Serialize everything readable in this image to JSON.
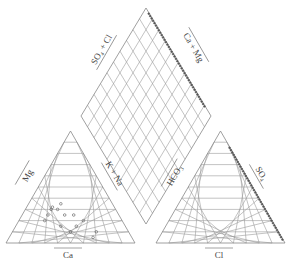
{
  "diagram": {
    "type": "piper",
    "labels": {
      "left_mg": "Mg",
      "left_kna": "K + Na",
      "left_ca": "Ca",
      "right_hco3": "HCO₃",
      "right_so4": "SO₄",
      "right_cl": "Cl",
      "diamond_so4cl": "SO₄ + Cl",
      "diamond_camg": "Ca + Mg"
    },
    "colors": {
      "grid": "#9a9a9a",
      "outline": "#888888",
      "points": "#555555",
      "text": "#444444"
    },
    "grid_divisions": 10
  },
  "chart_data": {
    "type": "scatter",
    "title": "",
    "cation_points_approx": [
      {
        "ca": 50,
        "mg": 30,
        "kna": 20
      },
      {
        "ca": 48,
        "mg": 32,
        "kna": 20
      },
      {
        "ca": 45,
        "mg": 30,
        "kna": 25
      },
      {
        "ca": 40,
        "mg": 35,
        "kna": 25
      },
      {
        "ca": 55,
        "mg": 25,
        "kna": 20
      },
      {
        "ca": 42,
        "mg": 25,
        "kna": 33
      },
      {
        "ca": 35,
        "mg": 25,
        "kna": 40
      },
      {
        "ca": 30,
        "mg": 20,
        "kna": 50
      },
      {
        "ca": 38,
        "mg": 15,
        "kna": 47
      },
      {
        "ca": 60,
        "mg": 20,
        "kna": 20
      },
      {
        "ca": 50,
        "mg": 15,
        "kna": 35
      },
      {
        "ca": 25,
        "mg": 10,
        "kna": 65
      },
      {
        "ca": 45,
        "mg": 10,
        "kna": 45
      },
      {
        "ca": 30,
        "mg": 5,
        "kna": 65
      }
    ],
    "anion_points": "clustered along HCO3=0 edge (SO4–Cl axis)",
    "diamond_points": "clustered along upper-right edge (Ca+Mg side)"
  }
}
